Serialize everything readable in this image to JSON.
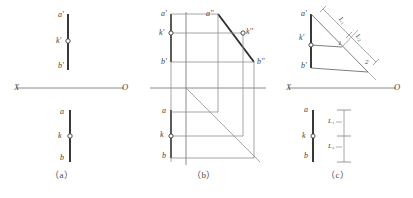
{
  "figure": {
    "background": "#ffffff",
    "ink": "#4a4a4a",
    "heavy_ink": "#2f2f2f",
    "width": 413,
    "height": 198
  },
  "captions": [
    {
      "id": "a",
      "text": "（a）",
      "x": 55,
      "y": 172
    },
    {
      "id": "b",
      "text": "（b）",
      "x": 192,
      "y": 172
    },
    {
      "id": "c",
      "text": "（c）",
      "x": 328,
      "y": 172
    }
  ],
  "axes": [
    {
      "id": "axis-a",
      "left_label": "X",
      "right_label": "O",
      "y": 88,
      "x1": 16,
      "x2": 124
    },
    {
      "id": "axis-c",
      "left_label": "X",
      "right_label": "O",
      "y": 88,
      "x1": 288,
      "x2": 396
    }
  ],
  "panel_a": {
    "name": "panel-a-two-view-projection",
    "front_view": {
      "line_label": "a'b' front projection",
      "points": [
        {
          "label": "a'",
          "x": 58,
          "y": 16
        },
        {
          "label": "k'",
          "x": 56,
          "y": 41
        },
        {
          "label": "b'",
          "x": 58,
          "y": 66
        }
      ],
      "marker_point": "k'"
    },
    "top_view": {
      "line_label": "ab top projection",
      "points": [
        {
          "label": "a",
          "x": 60,
          "y": 112
        },
        {
          "label": "k",
          "x": 58,
          "y": 136
        },
        {
          "label": "b",
          "x": 60,
          "y": 158
        }
      ],
      "marker_point": "k"
    }
  },
  "panel_b": {
    "name": "panel-b-three-view-projection",
    "front_view_points": [
      {
        "label": "a'",
        "x": 163,
        "y": 16
      },
      {
        "label": "k'",
        "x": 161,
        "y": 33
      },
      {
        "label": "b'",
        "x": 163,
        "y": 62
      }
    ],
    "side_view_points": [
      {
        "label": "a''",
        "x": 207,
        "y": 16
      },
      {
        "label": "k''",
        "x": 243,
        "y": 33
      },
      {
        "label": "b''",
        "x": 254,
        "y": 62
      }
    ],
    "top_view_points": [
      {
        "label": "a",
        "x": 165,
        "y": 111
      },
      {
        "label": "k",
        "x": 163,
        "y": 135
      },
      {
        "label": "b",
        "x": 165,
        "y": 155
      }
    ],
    "miter_line": "45-degree transfer line",
    "marker_points": [
      "k'",
      "k''",
      "k"
    ]
  },
  "panel_c": {
    "name": "panel-c-proportional-division",
    "front_view_points": [
      {
        "label": "a'",
        "x": 304,
        "y": 15
      },
      {
        "label": "k'",
        "x": 302,
        "y": 38
      },
      {
        "label": "b'",
        "x": 304,
        "y": 64
      }
    ],
    "top_view_points": [
      {
        "label": "a",
        "x": 306,
        "y": 110
      },
      {
        "label": "k",
        "x": 304,
        "y": 136
      },
      {
        "label": "b",
        "x": 306,
        "y": 156
      }
    ],
    "construction_numbers": [
      {
        "label": "1",
        "x": 338,
        "y": 42
      },
      {
        "label": "2",
        "x": 353,
        "y": 59
      }
    ],
    "dimensions_aux": [
      {
        "label": "L₁",
        "x": 345,
        "y": 20
      },
      {
        "label": "L₂",
        "x": 358,
        "y": 38
      }
    ],
    "dimensions_top": [
      {
        "label": "L₁",
        "x": 341,
        "y": 118
      },
      {
        "label": "L₂",
        "x": 341,
        "y": 141
      }
    ],
    "marker_points": [
      "k'",
      "k"
    ]
  }
}
